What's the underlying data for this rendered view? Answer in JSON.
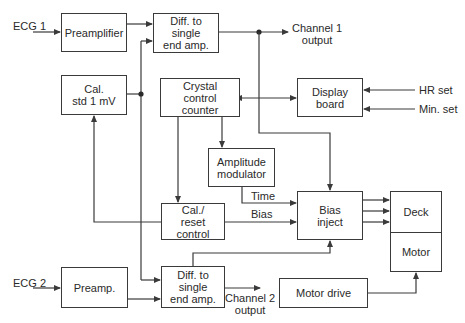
{
  "diagram": {
    "type": "block-diagram",
    "blocks": {
      "preamplifier": "Preamplifier",
      "diff_top": "Diff. to\nsingle\nend amp.",
      "cal_std": "Cal.\nstd 1 mV",
      "crystal": "Crystal\ncontrol\ncounter",
      "display": "Display\nboard",
      "amp_mod": "Amplitude\nmodulator",
      "cal_reset": "Cal./\nreset\ncontrol",
      "bias_inject": "Bias\ninject",
      "deck": "Deck",
      "motor": "Motor",
      "diff_bottom": "Diff. to\nsingle\nend amp.",
      "preamp": "Preamp.",
      "motor_drive": "Motor drive"
    },
    "labels": {
      "ecg1": "ECG 1",
      "ecg2": "ECG 2",
      "channel1": "Channel 1\noutput",
      "channel2": "Channel 2\noutput",
      "hr_set": "HR set",
      "min_set": "Min. set",
      "time": "Time",
      "bias": "Bias"
    },
    "connections": [
      {
        "from": "ECG 1",
        "to": "Preamplifier"
      },
      {
        "from": "Preamplifier",
        "to": "Diff. to single end amp. (top)"
      },
      {
        "from": "Cal. std 1 mV",
        "to": "Diff. to single end amp. (top)"
      },
      {
        "from": "Cal. std 1 mV",
        "to": "Diff. to single end amp. (bottom)"
      },
      {
        "from": "Diff. to single end amp. (top)",
        "to": "Channel 1 output"
      },
      {
        "from": "Channel 1 output junction",
        "to": "Bias inject"
      },
      {
        "from": "Crystal control counter",
        "to": "Display board",
        "bidirectional": true
      },
      {
        "from": "HR set",
        "to": "Display board"
      },
      {
        "from": "Min. set",
        "to": "Display board"
      },
      {
        "from": "Crystal control counter",
        "to": "Amplitude modulator"
      },
      {
        "from": "Crystal control counter",
        "to": "Cal./reset control"
      },
      {
        "from": "Amplitude modulator",
        "to": "Bias inject",
        "label": "Time"
      },
      {
        "from": "Cal./reset control",
        "to": "Bias inject",
        "label": "Bias"
      },
      {
        "from": "Cal./reset control",
        "to": "Cal. std 1 mV"
      },
      {
        "from": "Bias inject",
        "to": "Deck",
        "count": 3
      },
      {
        "from": "ECG 2",
        "to": "Preamp."
      },
      {
        "from": "Preamp.",
        "to": "Diff. to single end amp. (bottom)"
      },
      {
        "from": "Diff. to single end amp. (bottom)",
        "to": "Bias inject"
      },
      {
        "from": "Diff. to single end amp. (bottom)",
        "to": "Channel 2 output"
      },
      {
        "from": "Motor drive",
        "to": "Motor"
      }
    ]
  }
}
